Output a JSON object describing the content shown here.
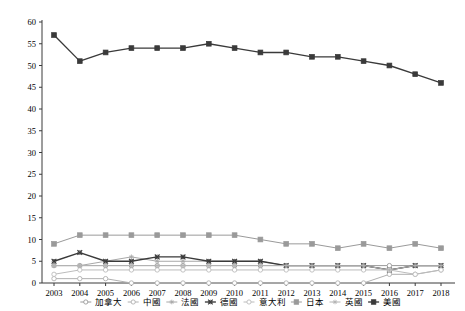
{
  "chart_data": {
    "type": "line",
    "title": "",
    "xlabel": "",
    "ylabel": "",
    "ylim": [
      0,
      60
    ],
    "ytick_step": 5,
    "grid": false,
    "legend_position": "bottom",
    "categories": [
      "2003",
      "2004",
      "2005",
      "2006",
      "2007",
      "2008",
      "2009",
      "2010",
      "2011",
      "2012",
      "2013",
      "2014",
      "2015",
      "2016",
      "2017",
      "2018"
    ],
    "yticks": [
      "0",
      "5",
      "10",
      "15",
      "20",
      "25",
      "30",
      "35",
      "40",
      "45",
      "50",
      "55",
      "60"
    ],
    "series": [
      {
        "name": "加拿大",
        "marker": "open-circle",
        "color": "#9a9a9a",
        "values": [
          4,
          4,
          4,
          4,
          4,
          4,
          4,
          4,
          4,
          4,
          4,
          4,
          4,
          4,
          4,
          4
        ]
      },
      {
        "name": "中國",
        "marker": "open-circle",
        "color": "#b0b0b0",
        "values": [
          1,
          1,
          1,
          0,
          0,
          0,
          0,
          0,
          0,
          0,
          0,
          0,
          0,
          2,
          2,
          3
        ]
      },
      {
        "name": "法國",
        "marker": "asterisk",
        "color": "#a8a8a8",
        "values": [
          4,
          4,
          5,
          6,
          5,
          5,
          5,
          5,
          5,
          4,
          4,
          4,
          4,
          3,
          4,
          4
        ]
      },
      {
        "name": "德國",
        "marker": "cross-x",
        "color": "#3a3a3a",
        "values": [
          5,
          7,
          5,
          5,
          6,
          6,
          5,
          5,
          5,
          4,
          4,
          4,
          4,
          3,
          4,
          4
        ]
      },
      {
        "name": "意大利",
        "marker": "open-circle",
        "color": "#bcbcbc",
        "values": [
          2,
          3,
          3,
          3,
          3,
          3,
          3,
          3,
          3,
          3,
          3,
          3,
          3,
          3,
          2,
          3
        ]
      },
      {
        "name": "日本",
        "marker": "filled-square",
        "color": "#9a9a9a",
        "values": [
          9,
          11,
          11,
          11,
          11,
          11,
          11,
          11,
          10,
          9,
          9,
          8,
          9,
          8,
          9,
          8
        ]
      },
      {
        "name": "英國",
        "marker": "asterisk",
        "color": "#b4b4b4",
        "values": [
          4,
          4,
          4,
          4,
          4,
          4,
          4,
          4,
          4,
          4,
          4,
          4,
          4,
          3,
          4,
          4
        ]
      },
      {
        "name": "美國",
        "marker": "filled-square",
        "color": "#3a3a3a",
        "values": [
          57,
          51,
          53,
          54,
          54,
          54,
          55,
          54,
          53,
          53,
          52,
          52,
          51,
          50,
          48,
          46
        ]
      }
    ]
  },
  "legend": {
    "items": [
      {
        "label": "加拿大"
      },
      {
        "label": "中國"
      },
      {
        "label": "法國"
      },
      {
        "label": "德國"
      },
      {
        "label": "意大利"
      },
      {
        "label": "日本"
      },
      {
        "label": "英國"
      },
      {
        "label": "美國"
      }
    ]
  }
}
